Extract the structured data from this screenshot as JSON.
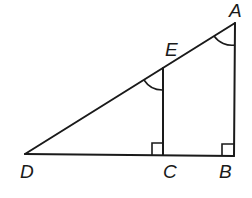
{
  "figure": {
    "type": "geometry",
    "stroke_color": "#1a1a1a",
    "background": "#ffffff"
  },
  "points": {
    "A": {
      "label": "A",
      "x": 235,
      "y": 23
    },
    "B": {
      "label": "B",
      "x": 234,
      "y": 156
    },
    "C": {
      "label": "C",
      "x": 163,
      "y": 155
    },
    "D": {
      "label": "D",
      "x": 25,
      "y": 154
    },
    "E": {
      "label": "E",
      "x": 163,
      "y": 68
    }
  },
  "segments": [
    {
      "name": "DA",
      "from": "D",
      "to": "A"
    },
    {
      "name": "DB",
      "from": "D",
      "to": "B"
    },
    {
      "name": "AB",
      "from": "A",
      "to": "B"
    },
    {
      "name": "EC",
      "from": "E",
      "to": "C"
    }
  ],
  "marks": {
    "right_angles": [
      "C",
      "B"
    ],
    "congruent_angle_arcs": [
      "A",
      "E"
    ]
  },
  "labels": {
    "A": "A",
    "B": "B",
    "C": "C",
    "D": "D",
    "E": "E"
  }
}
